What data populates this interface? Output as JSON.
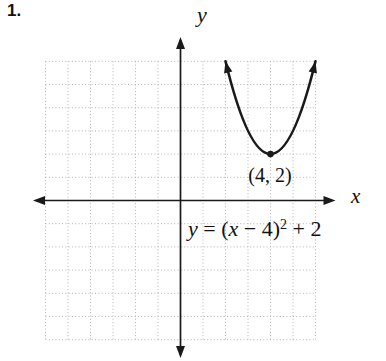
{
  "page": {
    "problem_number": "1."
  },
  "chart_data": {
    "type": "line",
    "title": "",
    "function_label": "y = (x − 4)² + 2",
    "coefficient_a": 1,
    "vertex": {
      "x": 4,
      "y": 2
    },
    "vertex_label": "(4, 2)",
    "plotted_domain": [
      2,
      6
    ],
    "x_axis": {
      "label": "x",
      "range": [
        -6,
        6
      ],
      "tick_labels": false,
      "grid_unit": 1
    },
    "y_axis": {
      "label": "y",
      "range": [
        -6,
        6
      ],
      "tick_labels": false,
      "grid_unit": 1
    },
    "grid": {
      "visible": true,
      "style": "dotted"
    },
    "legend": {
      "visible": false
    },
    "colors": {
      "curve": "#1a1a1a",
      "axes": "#1a1a1a",
      "grid": "#b3b3b3",
      "point": "#1a1a1a"
    }
  },
  "equation_display": {
    "var_y": "y",
    "mid1": " = (",
    "var_x": "x",
    "mid2": " − 4)",
    "superscript": "2",
    "tail": " + 2"
  }
}
